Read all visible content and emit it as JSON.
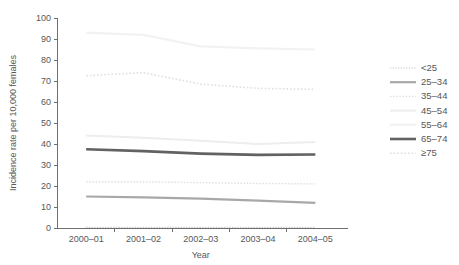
{
  "chart_data": {
    "type": "line",
    "title": "",
    "xlabel": "Year",
    "ylabel": "Incidence rate per 10,000 females",
    "categories": [
      "2000–01",
      "2001–02",
      "2002–03",
      "2003–04",
      "2004–05"
    ],
    "ylim": [
      0,
      100
    ],
    "yticks": [
      0,
      10,
      20,
      30,
      40,
      50,
      60,
      70,
      80,
      90,
      100
    ],
    "ytick_labels": [
      "0",
      "10",
      "20",
      "30",
      "40",
      "50",
      "60",
      "70",
      "80",
      "90",
      "100"
    ],
    "grid": false,
    "legend_position": "right",
    "series": [
      {
        "name": "<25",
        "values": [
          0.3,
          0.3,
          0.3,
          0.3,
          0.3
        ],
        "color": "#c9c9c9",
        "style": "dotted",
        "width": 1.2
      },
      {
        "name": "25–34",
        "values": [
          15,
          14.6,
          14,
          13,
          12
        ],
        "color": "#a8a8a8",
        "style": "solid",
        "width": 2.2
      },
      {
        "name": "35–44",
        "values": [
          22,
          22,
          21.6,
          21.2,
          21
        ],
        "color": "#e0e0e0",
        "style": "dotted",
        "width": 1.4
      },
      {
        "name": "45–54",
        "values": [
          44,
          43,
          41.5,
          40,
          41
        ],
        "color": "#ededed",
        "style": "solid",
        "width": 2.0
      },
      {
        "name": "55–64",
        "values": [
          93,
          92,
          86.5,
          85.5,
          85
        ],
        "color": "#f2f2f2",
        "style": "solid",
        "width": 2.2
      },
      {
        "name": "65–74",
        "values": [
          37.5,
          36.6,
          35.4,
          34.8,
          35
        ],
        "color": "#626262",
        "style": "solid",
        "width": 2.6
      },
      {
        "name": "≥75",
        "values": [
          72.5,
          74,
          68.5,
          66.5,
          66
        ],
        "color": "#e2e2e2",
        "style": "dotted",
        "width": 1.6
      }
    ]
  },
  "legend": {
    "items": [
      {
        "label": "<25"
      },
      {
        "label": "25–34"
      },
      {
        "label": "35–44"
      },
      {
        "label": "45–54"
      },
      {
        "label": "55–64"
      },
      {
        "label": "65–74"
      },
      {
        "label": "≥75"
      }
    ]
  },
  "axes": {
    "x_title": "Year",
    "y_title": "Incidence rate per 10,000 females"
  },
  "colors": {
    "axis": "#6f6f6f",
    "text": "#575757",
    "background": "#ffffff"
  }
}
